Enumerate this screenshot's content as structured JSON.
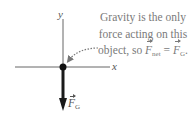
{
  "diagram": {
    "axes": {
      "x_label": "x",
      "y_label": "y"
    },
    "force": {
      "symbol": "F",
      "subscript": "G",
      "direction": "down"
    },
    "note": {
      "line1": "Gravity is the only",
      "line2": "force acting on this",
      "line3_prefix": "object, so ",
      "lhs_symbol": "F",
      "lhs_subscript": "net",
      "equals": " = ",
      "rhs_symbol": "F",
      "rhs_subscript": "G",
      "rhs_suffix": "."
    },
    "colors": {
      "axis": "#555555",
      "force_arrow": "#1a1a1a",
      "note_text": "#7a7a7a",
      "dotted_pointer": "#777777"
    }
  }
}
